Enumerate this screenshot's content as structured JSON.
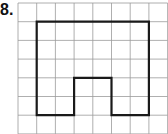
{
  "problem": {
    "number_label": "8."
  },
  "grid": {
    "origin_x": 18,
    "origin_y": 3,
    "cell_size": 18.7,
    "columns": 8,
    "rows": 7,
    "line_color": "#9a9a9a"
  },
  "shape": {
    "stroke_color": "#1a1a1a",
    "description": "Rectilinear outline with a rectangular notch at the bottom middle",
    "vertices_grid_units": [
      [
        1,
        1
      ],
      [
        7,
        1
      ],
      [
        7,
        6
      ],
      [
        5,
        6
      ],
      [
        5,
        4
      ],
      [
        3,
        4
      ],
      [
        3,
        6
      ],
      [
        1,
        6
      ]
    ]
  }
}
